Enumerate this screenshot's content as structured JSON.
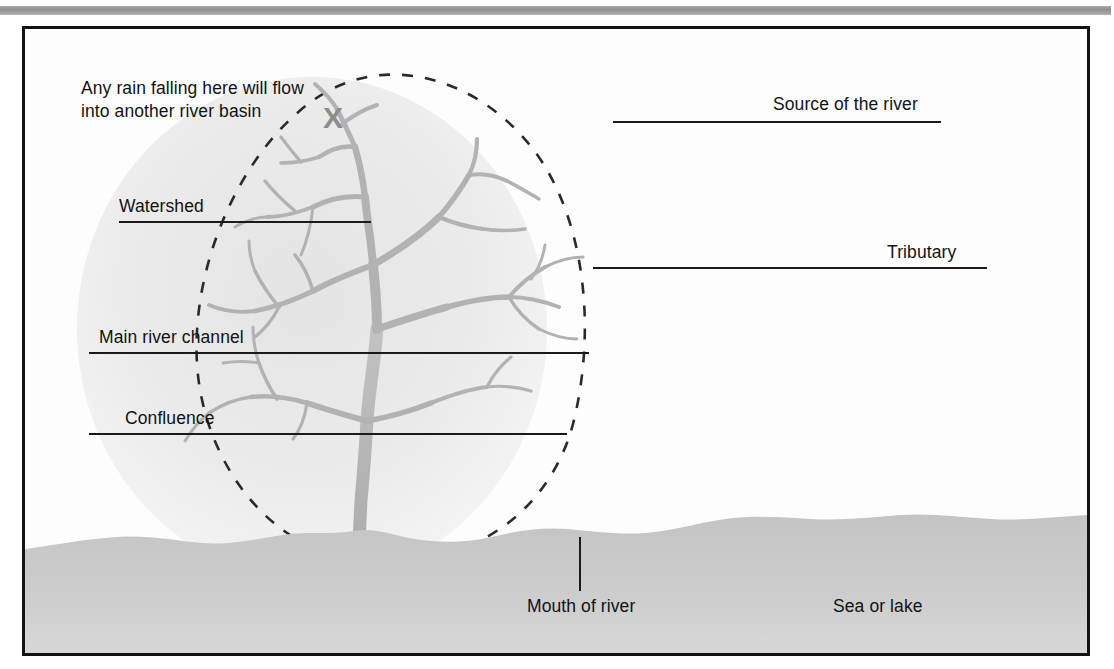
{
  "figure": {
    "type": "labelled-diagram",
    "colors": {
      "frame_border": "#141414",
      "page_background": "#fefefe",
      "terrain_fill": "#c9c9c9",
      "basin_fill": "#ededed",
      "river_stroke": "#b0b0b0",
      "leader_line": "#1a1a1a",
      "label_text": "#121212",
      "x_mark": "#8c8c8c",
      "scan_bar": "#9a9a9a"
    },
    "labels": {
      "rain_note": "Any rain falling here will flow\ninto another river basin",
      "x_mark": "X",
      "watershed": "Watershed",
      "main_river_channel": "Main river channel",
      "confluence": "Confluence",
      "source_of_the_river": "Source of the river",
      "tributary": "Tributary",
      "mouth_of_river": "Mouth of river",
      "sea_or_lake": "Sea or lake"
    },
    "elements": {
      "drainage_basin": "dashed-ellipse-boundary",
      "river_network": "dendritic-tree-channels",
      "terrain": "sea-or-lake-shaded-area"
    }
  }
}
